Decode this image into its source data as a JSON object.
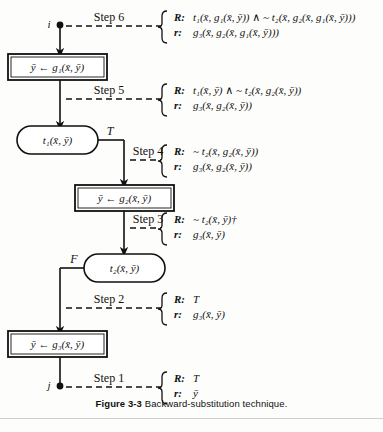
{
  "figure": {
    "caption_number": "Figure 3-3",
    "caption_text": "Backward-substitution technique."
  },
  "diagram": {
    "type": "flowchart",
    "entry_label": "i",
    "exit_label": "j",
    "nodes": [
      {
        "id": "entry",
        "kind": "terminal",
        "label": "i"
      },
      {
        "id": "assign1",
        "kind": "assignment",
        "label": "ȳ ← g₁(x̄, ȳ)"
      },
      {
        "id": "test1",
        "kind": "test",
        "label": "t₁(x̄, ȳ)"
      },
      {
        "id": "assign2",
        "kind": "assignment",
        "label": "ȳ ← g₂(x̄, ȳ)"
      },
      {
        "id": "test2",
        "kind": "test",
        "label": "t₂(x̄, ȳ)"
      },
      {
        "id": "assign3",
        "kind": "assignment",
        "label": "ȳ ← g₃(x̄, ȳ)"
      },
      {
        "id": "exit",
        "kind": "terminal",
        "label": "j"
      }
    ],
    "branch_labels": [
      {
        "from": "test1",
        "label": "T"
      },
      {
        "from": "test2",
        "label": "F"
      }
    ]
  },
  "steps": [
    {
      "name": "Step 6",
      "R_key": "R:",
      "R_value": "t₁(x̄, g₁(x̄, ȳ)) ∧ ~ t₂(x̄, g₂(x̄, g₁(x̄, ȳ)))",
      "r_key": "r:",
      "r_value": "g₃(x̄, g₂(x̄, g₁(x̄, ȳ)))"
    },
    {
      "name": "Step 5",
      "R_key": "R:",
      "R_value": "t₁(x̄, ȳ) ∧ ~ t₂(x̄, g₂(x̄, ȳ))",
      "r_key": "r:",
      "r_value": "g₃(x̄, g₂(x̄, ȳ))"
    },
    {
      "name": "Step 4",
      "R_key": "R:",
      "R_value": "~ t₂(x̄, g₂(x̄, ȳ))",
      "r_key": "r:",
      "r_value": "g₃(x̄, g₂(x̄, ȳ))"
    },
    {
      "name": "Step 3",
      "R_key": "R:",
      "R_value": "~ t₂(x̄, ȳ)†",
      "r_key": "r:",
      "r_value": "g₃(x̄, ȳ)"
    },
    {
      "name": "Step 2",
      "R_key": "R:",
      "R_value": "T",
      "r_key": "r:",
      "r_value": "g₃(x̄, ȳ)"
    },
    {
      "name": "Step 1",
      "R_key": "R:",
      "R_value": "T",
      "r_key": "r:",
      "r_value": "ȳ"
    }
  ],
  "colors": {
    "ink": "#111111",
    "paper": "#fdfdfb",
    "rule": "#cfcfcf"
  }
}
